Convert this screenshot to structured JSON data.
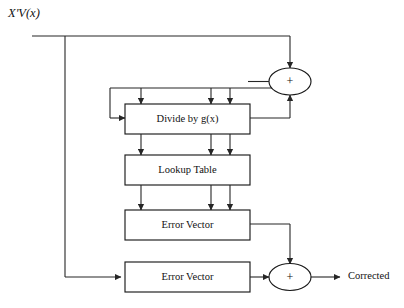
{
  "diagram": {
    "input_signal_label": "X'V(x)",
    "output_signal_label": "Corrected",
    "sum_symbol": "+",
    "colors": {
      "background": "#ffffff",
      "stroke": "#262626",
      "box_stroke": "#1a1a1a",
      "text": "#111111"
    },
    "blocks": [
      {
        "id": "divide",
        "label": "Divide by g(x)"
      },
      {
        "id": "lookup",
        "label": "Lookup Table"
      },
      {
        "id": "error_vector_1",
        "label": "Error Vector"
      },
      {
        "id": "error_vector_2",
        "label": "Error Vector"
      }
    ],
    "adders": [
      {
        "id": "adder_top",
        "label": "+"
      },
      {
        "id": "adder_bottom",
        "label": "+"
      }
    ]
  }
}
